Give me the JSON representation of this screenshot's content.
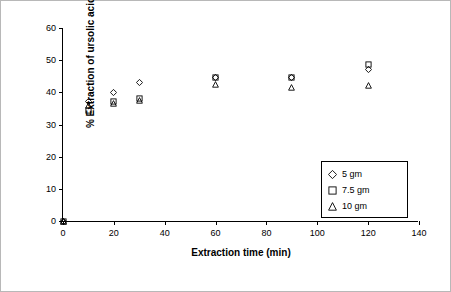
{
  "chart_data": {
    "type": "scatter",
    "title": "",
    "xlabel": "Extraction time (min)",
    "ylabel": "% Extraction of ursolic acid",
    "xlim": [
      0,
      140
    ],
    "ylim": [
      0,
      60
    ],
    "xticks": [
      0,
      20,
      40,
      60,
      80,
      100,
      120,
      140
    ],
    "yticks": [
      0,
      10,
      20,
      30,
      40,
      50,
      60
    ],
    "grid": false,
    "legend_position": "inside-right",
    "series": [
      {
        "name": "5 gm",
        "marker": "diamond",
        "points": [
          {
            "x": 0,
            "y": 0
          },
          {
            "x": 10,
            "y": 37
          },
          {
            "x": 20,
            "y": 40
          },
          {
            "x": 30,
            "y": 43
          },
          {
            "x": 60,
            "y": 44.5
          },
          {
            "x": 90,
            "y": 44.5
          },
          {
            "x": 120,
            "y": 47
          }
        ]
      },
      {
        "name": "7.5 gm",
        "marker": "square",
        "points": [
          {
            "x": 0,
            "y": 0
          },
          {
            "x": 10,
            "y": 34.5
          },
          {
            "x": 20,
            "y": 37
          },
          {
            "x": 30,
            "y": 38
          },
          {
            "x": 60,
            "y": 44.5
          },
          {
            "x": 90,
            "y": 44.5
          },
          {
            "x": 120,
            "y": 48.5
          }
        ]
      },
      {
        "name": "10 gm",
        "marker": "triangle",
        "points": [
          {
            "x": 0,
            "y": 0
          },
          {
            "x": 10,
            "y": 36
          },
          {
            "x": 20,
            "y": 36.5
          },
          {
            "x": 30,
            "y": 37.5
          },
          {
            "x": 60,
            "y": 42.5
          },
          {
            "x": 90,
            "y": 41.5
          },
          {
            "x": 120,
            "y": 42
          }
        ]
      }
    ]
  },
  "axis": {
    "y_labels": [
      "60",
      "50",
      "40",
      "30",
      "20",
      "10",
      "0"
    ],
    "x_labels": [
      "0",
      "20",
      "40",
      "60",
      "80",
      "100",
      "120",
      "140"
    ],
    "x_title": "Extraction time (min)",
    "y_title": "% Extraction of ursolic acid"
  },
  "legend": {
    "entries": [
      {
        "label": "5 gm",
        "marker": "diamond"
      },
      {
        "label": "7.5 gm",
        "marker": "square"
      },
      {
        "label": "10 gm",
        "marker": "triangle"
      }
    ]
  },
  "colors": {
    "axis": "#000000",
    "marker": "#000000",
    "background": "#ffffff",
    "frame": "#b8b8b8"
  }
}
